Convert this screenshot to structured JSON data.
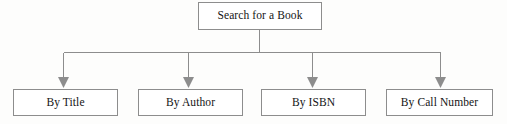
{
  "diagram": {
    "type": "hierarchy-tree",
    "title": "Search for a Book",
    "orientation": "top-down",
    "colors": {
      "box_border": "#8d8d8d",
      "box_fill": "#ffffff",
      "connector": "#8d8d8d",
      "text": "#141414",
      "background": "#fdfdfc"
    },
    "root": {
      "label": "Search for a Book"
    },
    "children": [
      {
        "label": "By Title"
      },
      {
        "label": "By Author"
      },
      {
        "label": "By ISBN"
      },
      {
        "label": "By Call Number"
      }
    ],
    "connectors": {
      "style": "orthogonal-bus",
      "arrowhead": "solid-triangle-down",
      "stem_from_root": true,
      "bus_y": 52,
      "arrow_count": 4
    }
  }
}
